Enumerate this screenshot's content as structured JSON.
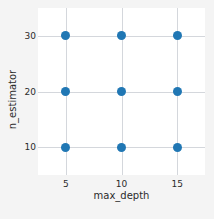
{
  "chart_data": {
    "type": "scatter",
    "title": "",
    "xlabel": "max_depth",
    "ylabel": "n_estimator",
    "xticks": [
      5,
      10,
      15
    ],
    "yticks": [
      10,
      20,
      30
    ],
    "xtick_labels": [
      "5",
      "10",
      "15"
    ],
    "ytick_labels": [
      "10",
      "20",
      "30"
    ],
    "xlim": [
      2.5,
      17.5
    ],
    "ylim": [
      5,
      35
    ],
    "grid": true,
    "legend": false,
    "marker_color": "#2077b4",
    "marker_size": 9,
    "grid_color": "#d4d7dc",
    "plot_background": "#ffffff",
    "figure_background": "#f4f4f4",
    "points": [
      {
        "x": 5,
        "y": 10
      },
      {
        "x": 10,
        "y": 10
      },
      {
        "x": 15,
        "y": 10
      },
      {
        "x": 5,
        "y": 20
      },
      {
        "x": 10,
        "y": 20
      },
      {
        "x": 15,
        "y": 20
      },
      {
        "x": 5,
        "y": 30
      },
      {
        "x": 10,
        "y": 30
      },
      {
        "x": 15,
        "y": 30
      }
    ]
  },
  "caption_fragment": ""
}
